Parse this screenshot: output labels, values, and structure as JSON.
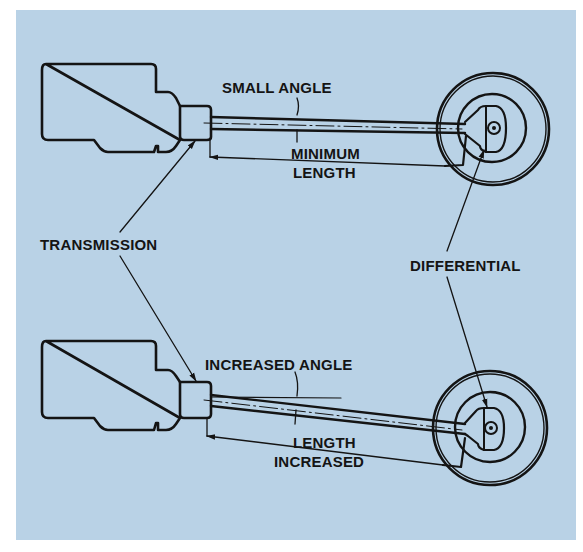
{
  "diagram": {
    "background_color": "#b9d2e6",
    "ink_color": "#141414",
    "top_view": {
      "angle_label": "SMALL ANGLE",
      "length_label_line1": "MINIMUM",
      "length_label_line2": "LENGTH"
    },
    "bottom_view": {
      "angle_label": "INCREASED ANGLE",
      "length_label_line1": "LENGTH",
      "length_label_line2": "INCREASED"
    },
    "callouts": {
      "transmission": "TRANSMISSION",
      "differential": "DIFFERENTIAL"
    }
  }
}
